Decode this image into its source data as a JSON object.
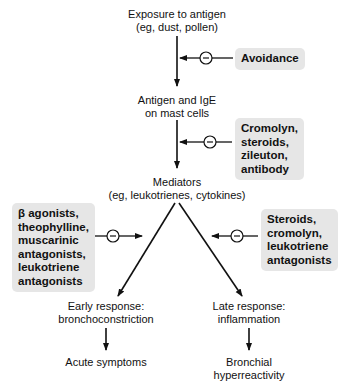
{
  "nodes": {
    "exposure": {
      "line1": "Exposure to antigen",
      "line2": "(eg, dust, pollen)"
    },
    "antigen_ige": {
      "line1": "Antigen and IgE",
      "line2": "on mast cells"
    },
    "mediators": {
      "line1": "Mediators",
      "line2": "(eg, leukotrienes, cytokines)"
    },
    "early": {
      "line1": "Early response:",
      "line2": "bronchoconstriction"
    },
    "late": {
      "line1": "Late response:",
      "line2": "inflammation"
    },
    "acute": {
      "line1": "Acute symptoms"
    },
    "bronchial": {
      "line1": "Bronchial",
      "line2": "hyperreactivity"
    }
  },
  "inhibitors": {
    "avoidance": {
      "lines": [
        "Avoidance"
      ]
    },
    "mast_cell": {
      "lines": [
        "Cromolyn,",
        "steroids,",
        "zileuton,",
        "antibody"
      ]
    },
    "early": {
      "lines": [
        "β agonists,",
        "theophylline,",
        "muscarinic",
        "antagonists,",
        "leukotriene",
        "antagonists"
      ]
    },
    "late": {
      "lines": [
        "Steroids,",
        "cromolyn,",
        "leukotriene",
        "antagonists"
      ]
    }
  },
  "symbols": {
    "inhibit": "−"
  },
  "colors": {
    "box_bg": "#e6e6e6",
    "line": "#111111"
  }
}
